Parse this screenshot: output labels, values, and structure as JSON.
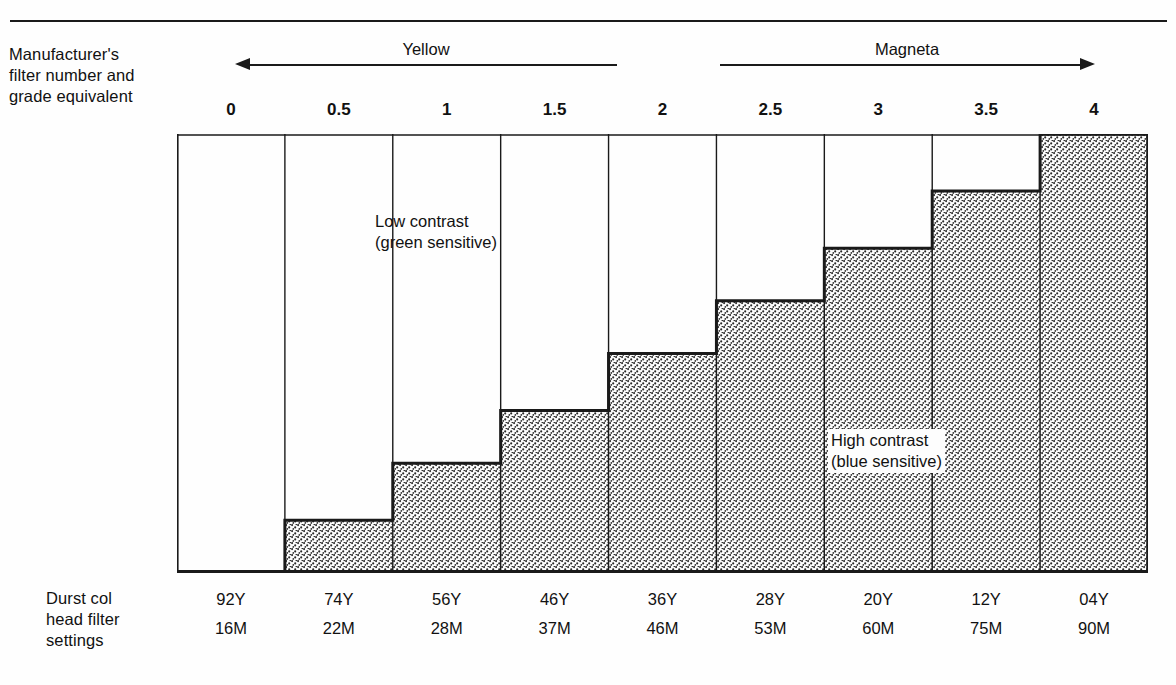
{
  "figure": {
    "left_labels": {
      "top": "Manufacturer's\nfilter number and\ngrade equivalent",
      "bottom": "Durst col\nhead filter\nsettings"
    },
    "bands": [
      {
        "name": "Yellow",
        "direction": "left"
      },
      {
        "name": "Magenta_label",
        "direction": "right"
      }
    ],
    "band_titles": {
      "yellow": "Yellow",
      "magenta": "Magneta"
    },
    "annotations": {
      "low": "Low contrast\n(green sensitive)",
      "high": "High contrast\n(blue sensitive)"
    }
  },
  "chart_data": {
    "type": "bar",
    "title": "",
    "xlabel": "Manufacturer's filter number and grade equivalent",
    "ylabel": "",
    "grid": false,
    "legend": "inline-annotations",
    "categories": [
      "0",
      "0.5",
      "1",
      "1.5",
      "2",
      "2.5",
      "3",
      "3.5",
      "4"
    ],
    "values": [
      0,
      12,
      25,
      37,
      50,
      62,
      74,
      87,
      100
    ],
    "ylim": [
      0,
      100
    ],
    "series": [
      {
        "name": "High contrast (blue sensitive)",
        "values": [
          0,
          12,
          25,
          37,
          50,
          62,
          74,
          87,
          100
        ]
      }
    ],
    "annotations": [
      {
        "text": "Low contrast\n(green sensitive)",
        "region": "upper-left"
      },
      {
        "text": "High contrast\n(blue sensitive)",
        "region": "lower-right"
      }
    ],
    "durst_filter_settings": {
      "yellow": [
        "92Y",
        "74Y",
        "56Y",
        "46Y",
        "36Y",
        "28Y",
        "20Y",
        "12Y",
        "04Y"
      ],
      "magenta": [
        "16M",
        "22M",
        "28M",
        "37M",
        "46M",
        "53M",
        "60M",
        "75M",
        "90M"
      ]
    }
  },
  "colors": {
    "ink": "#1a1a1a",
    "paper": "#fefefe",
    "shade": "#e8e8e8"
  }
}
